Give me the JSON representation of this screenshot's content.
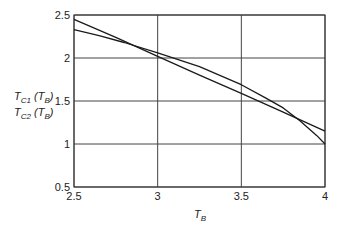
{
  "chart_data": {
    "type": "line",
    "title": "",
    "xlabel": "T_B",
    "ylabel": "T_C1 (T_B), T_C2 (T_B)",
    "xlim": [
      2.5,
      4
    ],
    "ylim": [
      0.5,
      2.5
    ],
    "xticks": [
      "2.5",
      "3",
      "3.5",
      "4"
    ],
    "yticks": [
      "0.5",
      "1",
      "1.5",
      "2",
      "2.5"
    ],
    "xtick_values": [
      2.5,
      3,
      3.5,
      4
    ],
    "ytick_values": [
      0.5,
      1,
      1.5,
      2,
      2.5
    ],
    "grid": true,
    "legend": "none",
    "series": [
      {
        "name": "T_C1(T_B)",
        "x": [
          2.5,
          2.75,
          3.0,
          3.25,
          3.5,
          3.75,
          4.0
        ],
        "values": [
          2.45,
          2.24,
          2.02,
          1.8,
          1.59,
          1.37,
          1.15
        ]
      },
      {
        "name": "T_C2(T_B)",
        "x": [
          2.5,
          2.65,
          2.8,
          3.0,
          3.25,
          3.5,
          3.65,
          3.75,
          3.85,
          3.95,
          4.0
        ],
        "values": [
          2.33,
          2.26,
          2.18,
          2.06,
          1.9,
          1.69,
          1.53,
          1.42,
          1.27,
          1.1,
          1.0
        ]
      }
    ]
  }
}
